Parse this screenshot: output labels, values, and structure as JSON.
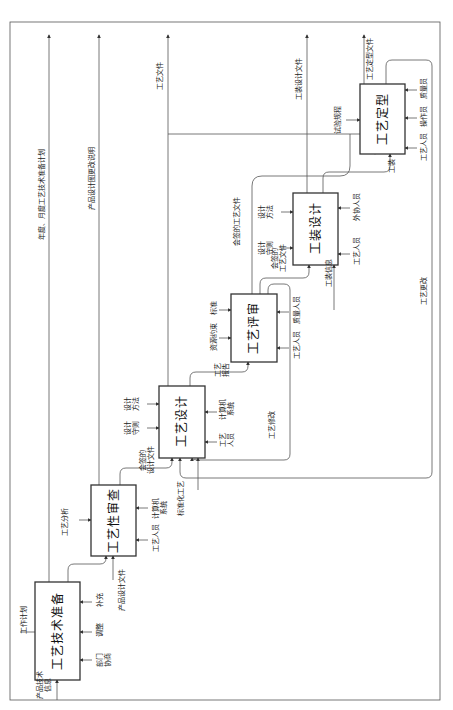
{
  "diagram": {
    "orientation": "rotated -90deg",
    "colors": {
      "line": "#555555",
      "box_border": "#333333",
      "text": "#222222",
      "background": "#ffffff"
    },
    "boxes": [
      {
        "id": "b1",
        "label": "工艺技术准备"
      },
      {
        "id": "b2",
        "label": "工艺性审查"
      },
      {
        "id": "b3",
        "label": "工艺设计"
      },
      {
        "id": "b4",
        "label": "工艺评审"
      },
      {
        "id": "b5",
        "label": "工装设计"
      },
      {
        "id": "b6",
        "label": "工艺定型"
      }
    ],
    "outputs": {
      "plan": "年度、月度工艺技术准备计划",
      "design_change": "产品设计图更改说明",
      "process_docs": "工艺文件",
      "tooling_docs": "工装设计文件",
      "finalized_docs": "工艺定型文件"
    },
    "labels": {
      "work_plan": "工作计划",
      "product_tech_info": "产品技术\n信息",
      "dept_coord": "部门\n协商",
      "adjust": "调整",
      "supplement": "补充",
      "product_design_docs": "产品设计文件",
      "process_analysis": "工艺分析",
      "b2_staff": "工艺人员",
      "b2_computer": "计算机\n系统",
      "signed_design_docs": "会签的\n设计文件",
      "design_rules": "设计\n守则",
      "design_methods": "设计\n方法",
      "standardized_process": "标准化工艺",
      "b3_staff": "工艺\n人员",
      "b3_computer": "计算机\n系统",
      "process_revision": "工艺修改",
      "process_report": "工艺\n报告",
      "resource_constraint": "资源约束",
      "standards": "标准",
      "b4_staff": "工艺人员",
      "quality_staff": "质量人员",
      "signed_process_docs_top": "会签的工艺文件",
      "signed_process_docs": "会签的\n工艺文件",
      "b5_rules": "设计\n守则",
      "b5_methods": "设计\n方法",
      "tooling_info": "工装信息",
      "b5_staff": "工艺人员",
      "external_staff": "外协人员",
      "trial_rules": "试验规程",
      "tooling": "工装",
      "b6_staff": "工艺人员",
      "operator": "操作员",
      "inspector": "质量员",
      "process_change": "工艺更改"
    }
  }
}
